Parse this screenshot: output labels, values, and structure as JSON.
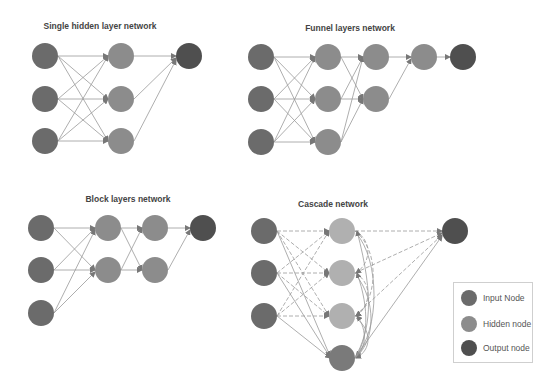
{
  "colors": {
    "input": "#6b6b6b",
    "hidden": "#8c8c8c",
    "hidden_light": "#b0b0b0",
    "output": "#4f4f4f",
    "edge": "#999999"
  },
  "diagrams": [
    {
      "id": "single",
      "title": "Single hidden layer network",
      "title_x": 100,
      "title_y": 27
    },
    {
      "id": "funnel",
      "title": "Funnel layers network",
      "title_x": 350,
      "title_y": 27
    },
    {
      "id": "block",
      "title": "Block layers network",
      "title_x": 128,
      "title_y": 198
    },
    {
      "id": "cascade",
      "title": "Cascade network",
      "title_x": 333,
      "title_y": 200
    }
  ],
  "legend": {
    "items": [
      {
        "label": "Input Node",
        "color": "#6b6b6b"
      },
      {
        "label": "Hidden node",
        "color": "#8c8c8c"
      },
      {
        "label": "Output node",
        "color": "#4f4f4f"
      }
    ]
  }
}
